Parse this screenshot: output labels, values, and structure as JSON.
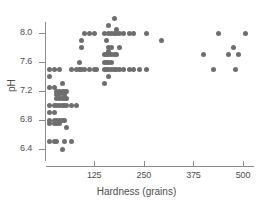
{
  "chart_data": {
    "type": "scatter",
    "title": "",
    "xlabel": "Hardness (grains)",
    "ylabel": "pH",
    "xlim": [
      0,
      525
    ],
    "ylim": [
      6.25,
      8.25
    ],
    "xticks": [
      125,
      250,
      375,
      500
    ],
    "xtick_labels": [
      "125",
      "250",
      "375",
      "500"
    ],
    "yticks": [
      6.4,
      6.8,
      7.2,
      7.6,
      8.0
    ],
    "ytick_labels": [
      "6.4",
      "6.8",
      "7.2",
      "7.6",
      "8.0"
    ],
    "grid": false,
    "legend": null,
    "marker_color": "#6e6e6e",
    "axis_color": "#8a8a8a",
    "text_color": "#4d4d4d",
    "points": [
      [
        13,
        7.5
      ],
      [
        13,
        7.4
      ],
      [
        13,
        7.25
      ],
      [
        13,
        7.0
      ],
      [
        13,
        6.9
      ],
      [
        13,
        6.8
      ],
      [
        13,
        6.75
      ],
      [
        13,
        6.5
      ],
      [
        25,
        7.5
      ],
      [
        25,
        7.25
      ],
      [
        25,
        7.0
      ],
      [
        25,
        6.9
      ],
      [
        25,
        6.8
      ],
      [
        25,
        6.75
      ],
      [
        25,
        6.5
      ],
      [
        31,
        7.2
      ],
      [
        31,
        7.15
      ],
      [
        31,
        7.1
      ],
      [
        31,
        7.0
      ],
      [
        31,
        6.8
      ],
      [
        31,
        6.75
      ],
      [
        31,
        6.5
      ],
      [
        38,
        7.5
      ],
      [
        38,
        7.2
      ],
      [
        38,
        7.15
      ],
      [
        38,
        7.1
      ],
      [
        38,
        7.0
      ],
      [
        38,
        6.8
      ],
      [
        38,
        6.75
      ],
      [
        44,
        7.3
      ],
      [
        44,
        7.2
      ],
      [
        44,
        7.1
      ],
      [
        44,
        7.0
      ],
      [
        44,
        6.8
      ],
      [
        44,
        6.4
      ],
      [
        50,
        7.2
      ],
      [
        50,
        7.15
      ],
      [
        50,
        7.1
      ],
      [
        50,
        7.0
      ],
      [
        50,
        6.8
      ],
      [
        50,
        6.5
      ],
      [
        56,
        7.2
      ],
      [
        56,
        7.1
      ],
      [
        56,
        7.0
      ],
      [
        56,
        6.7
      ],
      [
        69,
        7.5
      ],
      [
        69,
        7.0
      ],
      [
        69,
        6.5
      ],
      [
        81,
        7.5
      ],
      [
        81,
        7.0
      ],
      [
        88,
        7.5
      ],
      [
        88,
        7.6
      ],
      [
        94,
        7.9
      ],
      [
        94,
        7.8
      ],
      [
        94,
        7.5
      ],
      [
        100,
        8.0
      ],
      [
        100,
        7.5
      ],
      [
        113,
        8.0
      ],
      [
        113,
        7.5
      ],
      [
        125,
        8.0
      ],
      [
        125,
        7.5
      ],
      [
        131,
        7.5
      ],
      [
        150,
        8.0
      ],
      [
        150,
        7.7
      ],
      [
        150,
        7.6
      ],
      [
        150,
        7.5
      ],
      [
        150,
        7.3
      ],
      [
        156,
        7.9
      ],
      [
        156,
        7.7
      ],
      [
        156,
        7.6
      ],
      [
        156,
        7.5
      ],
      [
        162,
        8.1
      ],
      [
        162,
        8.0
      ],
      [
        162,
        7.8
      ],
      [
        162,
        7.75
      ],
      [
        162,
        7.7
      ],
      [
        162,
        7.6
      ],
      [
        162,
        7.5
      ],
      [
        162,
        7.4
      ],
      [
        169,
        8.0
      ],
      [
        169,
        7.8
      ],
      [
        169,
        7.7
      ],
      [
        169,
        7.6
      ],
      [
        169,
        7.5
      ],
      [
        175,
        8.2
      ],
      [
        175,
        8.0
      ],
      [
        175,
        7.7
      ],
      [
        175,
        7.5
      ],
      [
        181,
        8.05
      ],
      [
        181,
        8.0
      ],
      [
        181,
        7.7
      ],
      [
        181,
        7.5
      ],
      [
        188,
        8.0
      ],
      [
        188,
        7.8
      ],
      [
        188,
        7.5
      ],
      [
        200,
        8.0
      ],
      [
        200,
        7.5
      ],
      [
        213,
        8.0
      ],
      [
        213,
        7.5
      ],
      [
        225,
        8.0
      ],
      [
        225,
        7.5
      ],
      [
        238,
        7.5
      ],
      [
        256,
        8.0
      ],
      [
        256,
        7.5
      ],
      [
        294,
        7.9
      ],
      [
        400,
        7.7
      ],
      [
        425,
        7.5
      ],
      [
        438,
        8.0
      ],
      [
        463,
        7.7
      ],
      [
        475,
        7.8
      ],
      [
        481,
        7.5
      ],
      [
        488,
        7.7
      ],
      [
        506,
        8.0
      ]
    ]
  }
}
